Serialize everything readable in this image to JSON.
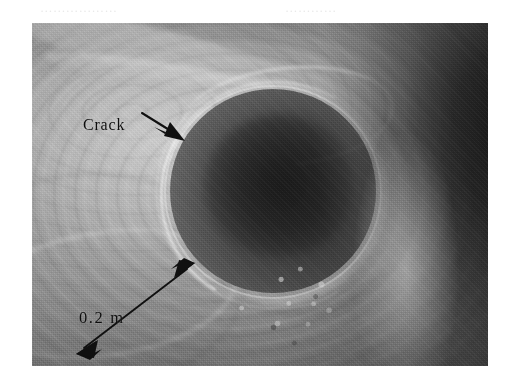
{
  "figure": {
    "kind": "photograph",
    "ghost_text_top_left": "………………",
    "ghost_text_top_right": "…………",
    "frame": {
      "left": 32,
      "top": 23,
      "width": 456,
      "height": 343,
      "background_color": "#ffffff"
    }
  },
  "annotations": [
    {
      "id": "crack",
      "label": "Crack",
      "type": "leader-arrow",
      "arrowheads": "single",
      "color": "#0d0d0d",
      "points": "from text at upper-left, arrow down-right to the bore rim"
    },
    {
      "id": "scale",
      "label": "0.2 m",
      "type": "dimension-arrow",
      "arrowheads": "double",
      "color": "#0d0d0d",
      "points": "from lower-left of frame up-right to the bore rim"
    }
  ],
  "colors": {
    "paper": "#ffffff",
    "rock_light": "#cfcfcf",
    "rock_mid": "#9a9a9a",
    "shadow_dark": "#2a2a2a",
    "hole_core": "#2e2e2e",
    "annotation_ink": "#0d0d0d"
  }
}
